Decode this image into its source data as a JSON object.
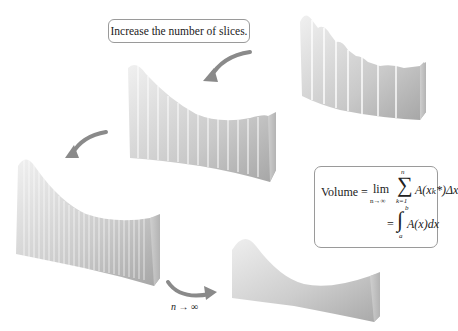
{
  "figure": {
    "callout_text": "Increase the number of slices.",
    "limit_label": "n → ∞",
    "limit_label_parts": {
      "variable": "n",
      "arrow": "→",
      "infinity": "∞"
    },
    "formula": {
      "lhs": "Volume =",
      "lim": "lim",
      "lim_sub": "n→∞",
      "sigma": "∑",
      "sigma_top": "n",
      "sigma_bottom": "k=1",
      "summand": "A(xₖ*)Δx",
      "eq2": "=",
      "integral": "∫",
      "int_upper": "b",
      "int_lower": "a",
      "integrand": "A(x)dx"
    },
    "solids": [
      {
        "name": "few-slices-solid",
        "slices": 8
      },
      {
        "name": "more-slices-solid",
        "slices": 16
      },
      {
        "name": "many-slices-solid",
        "slices": 30
      },
      {
        "name": "smooth-solid",
        "slices": 0
      }
    ],
    "colors": {
      "solid_light": "#e6e6e6",
      "solid_dark": "#a9a9a9",
      "arrow": "#8a8a8a",
      "border": "#9a9a9a"
    }
  }
}
